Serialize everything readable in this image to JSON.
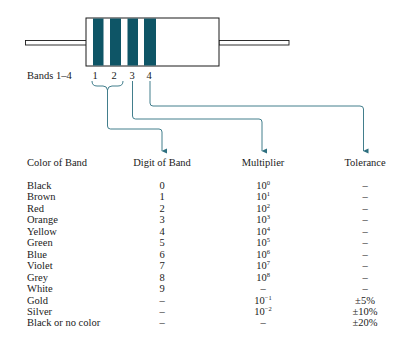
{
  "colors": {
    "band": "#0e5566",
    "connector": "#2d6f7f",
    "outline": "#1a1a1a"
  },
  "diagram": {
    "bands_label": "Bands 1–4",
    "band_numbers": [
      "1",
      "2",
      "3",
      "4"
    ]
  },
  "table": {
    "headers": {
      "color": "Color of Band",
      "digit": "Digit of Band",
      "multiplier": "Multiplier",
      "tolerance": "Tolerance"
    },
    "rows": [
      {
        "color": "Black",
        "digit": "0",
        "mult_base": "10",
        "mult_exp": "0",
        "tolerance": "–"
      },
      {
        "color": "Brown",
        "digit": "1",
        "mult_base": "10",
        "mult_exp": "1",
        "tolerance": "–"
      },
      {
        "color": "Red",
        "digit": "2",
        "mult_base": "10",
        "mult_exp": "2",
        "tolerance": "–"
      },
      {
        "color": "Orange",
        "digit": "3",
        "mult_base": "10",
        "mult_exp": "3",
        "tolerance": "–"
      },
      {
        "color": "Yellow",
        "digit": "4",
        "mult_base": "10",
        "mult_exp": "4",
        "tolerance": "–"
      },
      {
        "color": "Green",
        "digit": "5",
        "mult_base": "10",
        "mult_exp": "5",
        "tolerance": "–"
      },
      {
        "color": "Blue",
        "digit": "6",
        "mult_base": "10",
        "mult_exp": "6",
        "tolerance": "–"
      },
      {
        "color": "Violet",
        "digit": "7",
        "mult_base": "10",
        "mult_exp": "7",
        "tolerance": "–"
      },
      {
        "color": "Grey",
        "digit": "8",
        "mult_base": "10",
        "mult_exp": "8",
        "tolerance": "–"
      },
      {
        "color": "White",
        "digit": "9",
        "mult_base": "–",
        "mult_exp": "",
        "tolerance": "–"
      },
      {
        "color": "Gold",
        "digit": "–",
        "mult_base": "10",
        "mult_exp": "−1",
        "tolerance": "±5%"
      },
      {
        "color": "Silver",
        "digit": "–",
        "mult_base": "10",
        "mult_exp": "−2",
        "tolerance": "±10%"
      },
      {
        "color": "Black or no color",
        "digit": "–",
        "mult_base": "–",
        "mult_exp": "",
        "tolerance": "±20%"
      }
    ]
  }
}
